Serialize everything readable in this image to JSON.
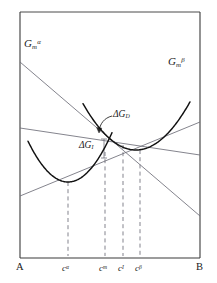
{
  "figure": {
    "background_color": "#ffffff",
    "frame_color": "#3a3a3a",
    "curve_color": "#111111",
    "line_color": "#6e6e78",
    "dash_color": "#6e6e78",
    "text_color": "#1a1a1a"
  },
  "labels": {
    "curve_alpha": {
      "symbol": "G",
      "sub": "m",
      "sup": "α"
    },
    "curve_beta": {
      "symbol": "G",
      "sub": "m",
      "sup": "β"
    },
    "delta_gd": {
      "symbol": "ΔG",
      "sub": "D"
    },
    "delta_gi": {
      "symbol": "ΔG",
      "sub": "I"
    }
  },
  "axis": {
    "left_endpoint": "A",
    "right_endpoint": "B",
    "ticks": [
      {
        "name": "c-alpha",
        "symbol": "c",
        "sup": "α",
        "x": 68
      },
      {
        "name": "c-m",
        "symbol": "c",
        "sup": "m",
        "x": 105
      },
      {
        "name": "c-I",
        "symbol": "c",
        "sup": "I",
        "x": 123
      },
      {
        "name": "c-beta",
        "symbol": "c",
        "sup": "β",
        "x": 140
      }
    ]
  },
  "chart_data": {
    "type": "line",
    "xlabel": "composition",
    "ylabel": "molar Gibbs energy",
    "grid": false,
    "legend": "inline-annotations",
    "xlim": [
      0,
      1
    ],
    "ylim": [
      0,
      1
    ],
    "frame": {
      "left": 20,
      "right": 200,
      "top": 12,
      "bottom": 258
    },
    "series": [
      {
        "name": "G_m^alpha",
        "label": "Gₘᵅ",
        "type": "parabola",
        "vertex": {
          "x": 68,
          "y": 182
        },
        "curvature": 0.0255,
        "x_range": [
          28,
          112
        ]
      },
      {
        "name": "G_m^beta",
        "label": "Gₘᵝ",
        "type": "parabola",
        "vertex": {
          "x": 136,
          "y": 150
        },
        "curvature": 0.0165,
        "x_range": [
          83,
          190
        ]
      }
    ],
    "straight_lines": [
      {
        "name": "common-tangent",
        "points": [
          {
            "x": 20,
            "y": 196
          },
          {
            "x": 200,
            "y": 122
          }
        ]
      },
      {
        "name": "parallel-tangent-upper",
        "points": [
          {
            "x": 20,
            "y": 128
          },
          {
            "x": 200,
            "y": 155
          }
        ]
      },
      {
        "name": "chemical-potential-line",
        "points": [
          {
            "x": 20,
            "y": 62
          },
          {
            "x": 200,
            "y": 216
          }
        ]
      }
    ],
    "dashed_verticals": [
      {
        "name": "c-alpha",
        "x": 68,
        "y_top": 182,
        "y_bottom": 258
      },
      {
        "name": "c-m",
        "x": 105,
        "y_top": 152,
        "y_bottom": 258
      },
      {
        "name": "c-I",
        "x": 123,
        "y_top": 145,
        "y_bottom": 258
      },
      {
        "name": "c-beta",
        "x": 140,
        "y_top": 150,
        "y_bottom": 258
      }
    ],
    "annotations": [
      {
        "name": "delta-G-D",
        "label": "ΔG_D",
        "x": 120,
        "y": 115
      },
      {
        "name": "delta-G-I",
        "label": "ΔG_I",
        "x": 86,
        "y": 148
      }
    ]
  }
}
